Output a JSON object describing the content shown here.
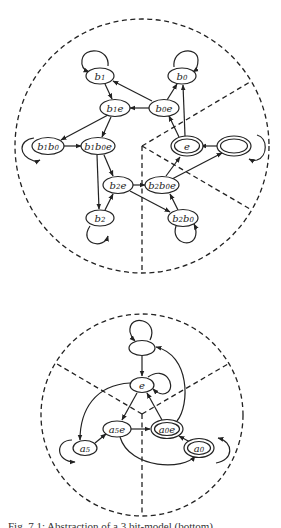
{
  "figure": {
    "caption": "Fig. 7.1: Abstraction of a 3 bit-model (bottom) ...",
    "diagrams": [
      {
        "id": "top",
        "boundary": "dashed circle divided into three sectors",
        "nodes": [
          {
            "id": "b1",
            "label": "b",
            "sub": "1",
            "tail": "",
            "accepting": false,
            "self_loop": true
          },
          {
            "id": "b0",
            "label": "b",
            "sub": "0",
            "tail": "",
            "accepting": false,
            "self_loop": true
          },
          {
            "id": "b1e",
            "label": "b",
            "sub": "1",
            "tail": "e",
            "accepting": false,
            "self_loop": false
          },
          {
            "id": "b0e",
            "label": "b",
            "sub": "0",
            "tail": "e",
            "accepting": false,
            "self_loop": false
          },
          {
            "id": "b1b0",
            "label": "b₁b",
            "sub": "0",
            "tail": "",
            "accepting": false,
            "self_loop": true
          },
          {
            "id": "b1b0e",
            "label": "b₁b",
            "sub": "0",
            "tail": "e",
            "accepting": false,
            "self_loop": false
          },
          {
            "id": "e",
            "label": "e",
            "sub": "",
            "tail": "",
            "accepting": true,
            "self_loop": false
          },
          {
            "id": "init",
            "label": "",
            "sub": "",
            "tail": "",
            "accepting": true,
            "self_loop": true
          },
          {
            "id": "b2e",
            "label": "b",
            "sub": "2",
            "tail": "e",
            "accepting": false,
            "self_loop": false
          },
          {
            "id": "b2b0e",
            "label": "b₂b",
            "sub": "0",
            "tail": "e",
            "accepting": false,
            "self_loop": false
          },
          {
            "id": "b2",
            "label": "b",
            "sub": "2",
            "tail": "",
            "accepting": false,
            "self_loop": true
          },
          {
            "id": "b2b0",
            "label": "b₂b",
            "sub": "0",
            "tail": "",
            "accepting": false,
            "self_loop": true
          }
        ],
        "edges": [
          [
            "init",
            "e"
          ],
          [
            "e",
            "b0"
          ],
          [
            "e",
            "b0e"
          ],
          [
            "b0e",
            "b0"
          ],
          [
            "b0e",
            "b1e"
          ],
          [
            "b0e",
            "b1"
          ],
          [
            "b1",
            "b1e"
          ],
          [
            "b1e",
            "b1b0"
          ],
          [
            "b1e",
            "b1b0e"
          ],
          [
            "b1b0",
            "b1b0e"
          ],
          [
            "b1b0e",
            "b2e"
          ],
          [
            "b1b0e",
            "b2"
          ],
          [
            "b2",
            "b2e"
          ],
          [
            "b2e",
            "b2b0e"
          ],
          [
            "b2e",
            "b2b0"
          ],
          [
            "b2b0",
            "b2b0e"
          ],
          [
            "b2b0e",
            "e"
          ],
          [
            "b2b0e",
            "init"
          ]
        ]
      },
      {
        "id": "bottom",
        "boundary": "dashed circle divided into three sectors",
        "nodes": [
          {
            "id": "init",
            "label": "",
            "sub": "",
            "tail": "",
            "accepting": false,
            "self_loop": true
          },
          {
            "id": "e",
            "label": "e",
            "sub": "",
            "tail": "",
            "accepting": false,
            "self_loop": true
          },
          {
            "id": "a5e",
            "label": "a",
            "sub": "5",
            "tail": "e",
            "accepting": false,
            "self_loop": false
          },
          {
            "id": "a0e",
            "label": "a",
            "sub": "0",
            "tail": "e",
            "accepting": true,
            "self_loop": false
          },
          {
            "id": "a5",
            "label": "a",
            "sub": "5",
            "tail": "",
            "accepting": false,
            "self_loop": true
          },
          {
            "id": "a0",
            "label": "a",
            "sub": "0",
            "tail": "",
            "accepting": true,
            "self_loop": true
          }
        ],
        "edges": [
          [
            "init",
            "e"
          ],
          [
            "e",
            "a5e"
          ],
          [
            "a0e",
            "e"
          ],
          [
            "a0e",
            "init"
          ],
          [
            "e",
            "a5"
          ],
          [
            "a5",
            "a5e"
          ],
          [
            "a5e",
            "a0e"
          ],
          [
            "a0",
            "a0e"
          ],
          [
            "a5e",
            "a0"
          ]
        ]
      }
    ]
  },
  "labels": {
    "top": {
      "b1": {
        "base": "b",
        "sub": "1",
        "tail": ""
      },
      "b0": {
        "base": "b",
        "sub": "0",
        "tail": ""
      },
      "b1e": {
        "base": "b",
        "sub": "1",
        "tail": "e"
      },
      "b0e": {
        "base": "b",
        "sub": "0",
        "tail": "e"
      },
      "b1b0": {
        "base": "b",
        "sub": "1",
        "base2": "b",
        "sub2": "0",
        "tail": ""
      },
      "b1b0e": {
        "base": "b",
        "sub": "1",
        "base2": "b",
        "sub2": "0",
        "tail": "e"
      },
      "e": {
        "base": "e"
      },
      "b2e": {
        "base": "b",
        "sub": "2",
        "tail": "e"
      },
      "b2b0e": {
        "base": "b",
        "sub": "2",
        "base2": "b",
        "sub2": "0",
        "tail": "e"
      },
      "b2": {
        "base": "b",
        "sub": "2",
        "tail": ""
      },
      "b2b0": {
        "base": "b",
        "sub": "2",
        "base2": "b",
        "sub2": "0",
        "tail": ""
      }
    },
    "bottom": {
      "e": {
        "base": "e"
      },
      "a5e": {
        "base": "a",
        "sub": "5",
        "tail": "e"
      },
      "a0e": {
        "base": "a",
        "sub": "0",
        "tail": "e"
      },
      "a5": {
        "base": "a",
        "sub": "5",
        "tail": ""
      },
      "a0": {
        "base": "a",
        "sub": "0",
        "tail": ""
      }
    }
  }
}
